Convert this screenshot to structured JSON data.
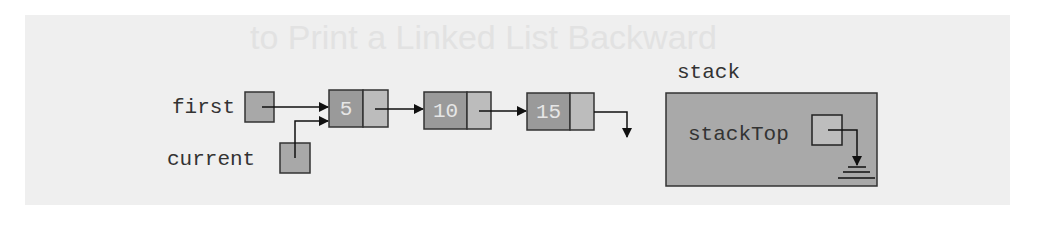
{
  "ghost_text": {
    "heading": "to Print a Linked List Backward"
  },
  "labels": {
    "first": "first",
    "current": "current",
    "stack": "stack",
    "stackTop": "stackTop"
  },
  "nodes": [
    {
      "value": "5"
    },
    {
      "value": "10"
    },
    {
      "value": "15"
    }
  ],
  "colors": {
    "panel": "#efefef",
    "node_info": "#9a9a9a",
    "node_link": "#bcbcbc",
    "pointer_box": "#a8a8a8",
    "stack_box": "#a9a9a9",
    "stack_top_box": "#bdbdbd",
    "stroke": "#222222"
  }
}
